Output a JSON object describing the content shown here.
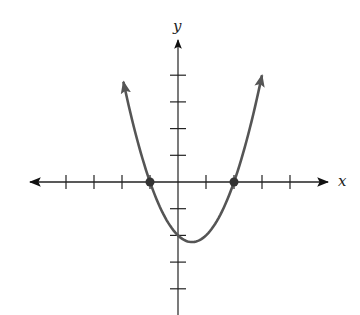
{
  "chart_data": {
    "type": "line",
    "title": "",
    "xlabel": "x",
    "ylabel": "y",
    "function": "y = x^2 - x - 2",
    "series": [
      {
        "name": "parabola",
        "color": "#555555",
        "x": [
          -1.95,
          -1.5,
          -1,
          -0.5,
          0,
          0.5,
          1,
          1.5,
          2,
          2.5,
          3.0
        ],
        "values": [
          3.75,
          1.75,
          0,
          -1.25,
          -2,
          -2.25,
          -2,
          -1.25,
          0,
          1.75,
          4.0
        ]
      }
    ],
    "marked_points": [
      {
        "x": -1,
        "y": 0,
        "label": "x-intercept"
      },
      {
        "x": 2,
        "y": 0,
        "label": "x-intercept"
      }
    ],
    "vertex": {
      "x": 0.5,
      "y": -2.25
    },
    "y_intercept": {
      "x": 0,
      "y": -2
    },
    "xlim": [
      -5,
      5.5
    ],
    "ylim": [
      -4.5,
      5
    ],
    "x_ticks": [
      -4,
      -3,
      -2,
      -1,
      1,
      2,
      3,
      4
    ],
    "y_ticks": [
      -4,
      -3,
      -2,
      -1,
      1,
      2,
      3,
      4
    ],
    "tick_labels_shown": false,
    "grid": false,
    "legend": "none",
    "arrows": {
      "x_axis": "both",
      "y_axis": "up",
      "curve_ends": "both"
    }
  },
  "colors": {
    "axis": "#222222",
    "curve": "#555555",
    "point": "#333333"
  }
}
